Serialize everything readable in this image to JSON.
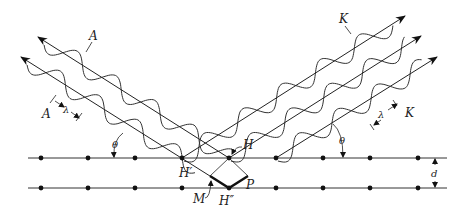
{
  "figure": {
    "labels": {
      "incident_wave": "A",
      "incident_wave_lower": "A",
      "diffracted_wave": "K",
      "diffracted_wave_lower": "K",
      "wavelength_left": "λ",
      "wavelength_right": "λ",
      "angle_left": "θ",
      "angle_right": "θ",
      "plane_spacing": "d",
      "point_H": "H",
      "point_H_prime": "H′",
      "point_H_double_prime": "H″",
      "point_M": "M",
      "point_P": "P"
    },
    "colors": {
      "ink": "#222222",
      "background": "#ffffff"
    },
    "geometry": {
      "plane_top_y": 158,
      "plane_bottom_y": 188,
      "plane_x_start": 28,
      "plane_x_end": 447,
      "atom_x": [
        41,
        88,
        135,
        182,
        229,
        276,
        323,
        370,
        418
      ],
      "theta_slope": 0.634,
      "incident_rays": [
        {
          "from": [
            38,
            37
          ],
          "to": [
            229,
            158
          ]
        },
        {
          "from": [
            21,
            57
          ],
          "to": [
            229,
            188
          ]
        }
      ],
      "diffracted_rays": [
        {
          "from": [
            182,
            158
          ],
          "to": [
            405,
            16
          ]
        },
        {
          "from": [
            229,
            158
          ],
          "to": [
            421,
            36
          ]
        },
        {
          "from": [
            276,
            158
          ],
          "to": [
            437,
            57
          ]
        }
      ]
    }
  }
}
